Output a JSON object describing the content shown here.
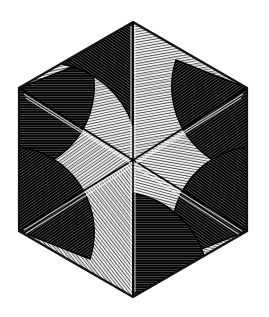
{
  "artwork": {
    "title": "Hexagonal Radial Woodcut Pattern",
    "medium": "wood engraving / line hatching",
    "background_color": "#ffffff",
    "ink_color": "#111111",
    "canvas": {
      "width": 269,
      "height": 317
    }
  },
  "geometry": {
    "shape": "hexagon",
    "orientation": "pointy-top",
    "center": {
      "x": 133,
      "y": 160
    },
    "vertices": [
      {
        "name": "top",
        "x": 133,
        "y": 22
      },
      {
        "name": "upper-right",
        "x": 247,
        "y": 88
      },
      {
        "name": "lower-right",
        "x": 247,
        "y": 231
      },
      {
        "name": "bottom",
        "x": 133,
        "y": 297
      },
      {
        "name": "lower-left",
        "x": 19,
        "y": 231
      },
      {
        "name": "upper-left",
        "x": 19,
        "y": 88
      }
    ],
    "spokes": 6,
    "sectors": 6,
    "outline_stroke_width": 2.2
  },
  "sectors": [
    {
      "id": "sector-top-right",
      "label": "Upper right sector",
      "from_vertex": "top",
      "to_vertex": "upper-right",
      "hatch_angle_deg": 80,
      "hatch_spacing": 2.0,
      "tone": "light",
      "fill_color": "#d8d8d8"
    },
    {
      "id": "sector-right",
      "label": "Right sector",
      "from_vertex": "upper-right",
      "to_vertex": "lower-right",
      "hatch_angle_deg": 10,
      "hatch_spacing": 2.0,
      "tone": "light",
      "fill_color": "#d4d4d4"
    },
    {
      "id": "sector-bottom-right",
      "label": "Lower right sector",
      "from_vertex": "lower-right",
      "to_vertex": "bottom",
      "hatch_angle_deg": 105,
      "hatch_spacing": 2.0,
      "tone": "light",
      "fill_color": "#d6d6d6"
    },
    {
      "id": "sector-bottom-left",
      "label": "Lower left sector",
      "from_vertex": "bottom",
      "to_vertex": "lower-left",
      "hatch_angle_deg": 52,
      "hatch_spacing": 2.0,
      "tone": "light",
      "fill_color": "#d2d2d2"
    },
    {
      "id": "sector-left",
      "label": "Left sector",
      "from_vertex": "lower-left",
      "to_vertex": "upper-left",
      "hatch_angle_deg": 145,
      "hatch_spacing": 2.0,
      "tone": "light",
      "fill_color": "#d5d5d5"
    },
    {
      "id": "sector-top-left",
      "label": "Upper left sector",
      "from_vertex": "upper-left",
      "to_vertex": "top",
      "hatch_angle_deg": 168,
      "hatch_spacing": 2.0,
      "tone": "light",
      "fill_color": "#d3d3d3"
    }
  ],
  "dark_wedges": [
    {
      "id": "wedge-upper-left",
      "label": "Dark arc wedge at upper-left vertex",
      "corner_vertex": "upper-left",
      "fill_color": "#2b2b2b",
      "hatch_angle_deg": 0,
      "hatch_spacing": 2.0
    },
    {
      "id": "wedge-top",
      "label": "Dark arc wedge below top vertex",
      "corner_vertex": "top",
      "fill_color": "#2e2e2e",
      "hatch_angle_deg": 35,
      "hatch_spacing": 2.0
    },
    {
      "id": "wedge-upper-right",
      "label": "Dark arc wedge at upper-right vertex",
      "corner_vertex": "upper-right",
      "fill_color": "#2c2c2c",
      "hatch_angle_deg": 145,
      "hatch_spacing": 2.0
    },
    {
      "id": "wedge-lower-right",
      "label": "Dark arc wedge at lower-right vertex",
      "corner_vertex": "lower-right",
      "fill_color": "#2b2b2b",
      "hatch_angle_deg": 35,
      "hatch_spacing": 2.0
    },
    {
      "id": "wedge-bottom",
      "label": "Dark arc wedge above bottom vertex",
      "corner_vertex": "bottom",
      "fill_color": "#2d2d2d",
      "hatch_angle_deg": 0,
      "hatch_spacing": 2.0
    },
    {
      "id": "wedge-lower-left",
      "label": "Dark arc wedge at lower-left vertex",
      "corner_vertex": "lower-left",
      "fill_color": "#2c2c2c",
      "hatch_angle_deg": 145,
      "hatch_spacing": 2.0
    }
  ]
}
